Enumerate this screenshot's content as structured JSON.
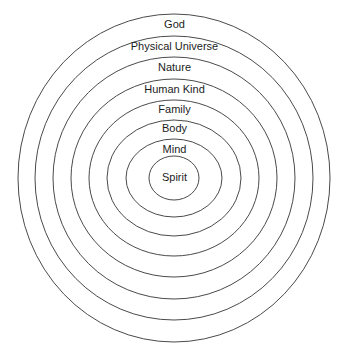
{
  "diagram": {
    "type": "concentric-circles",
    "title": "",
    "background_color": "#ffffff",
    "stroke_color": "#4a4a4a",
    "text_color": "#1c1c1c",
    "center_x": 174,
    "center_y": 178,
    "rings": [
      {
        "label": "God",
        "level": 1,
        "rx": 156,
        "ry": 164,
        "label_y": 19,
        "font_size": 11
      },
      {
        "label": "Physical Universe",
        "level": 2,
        "rx": 139,
        "ry": 142,
        "label_y": 41,
        "font_size": 11
      },
      {
        "label": "Nature",
        "level": 3,
        "rx": 121,
        "ry": 121,
        "label_y": 62,
        "font_size": 11
      },
      {
        "label": "Human Kind",
        "level": 4,
        "rx": 103,
        "ry": 99,
        "label_y": 84,
        "font_size": 11
      },
      {
        "label": "Family",
        "level": 5,
        "rx": 85,
        "ry": 78,
        "label_y": 104,
        "font_size": 11
      },
      {
        "label": "Body",
        "level": 6,
        "rx": 67,
        "ry": 58,
        "label_y": 123,
        "font_size": 11
      },
      {
        "label": "Mind",
        "level": 7,
        "rx": 48,
        "ry": 39,
        "label_y": 144,
        "font_size": 11
      },
      {
        "label": "Spirit",
        "level": 8,
        "rx": 25,
        "ry": 22,
        "label_y": 172,
        "font_size": 11
      }
    ]
  }
}
